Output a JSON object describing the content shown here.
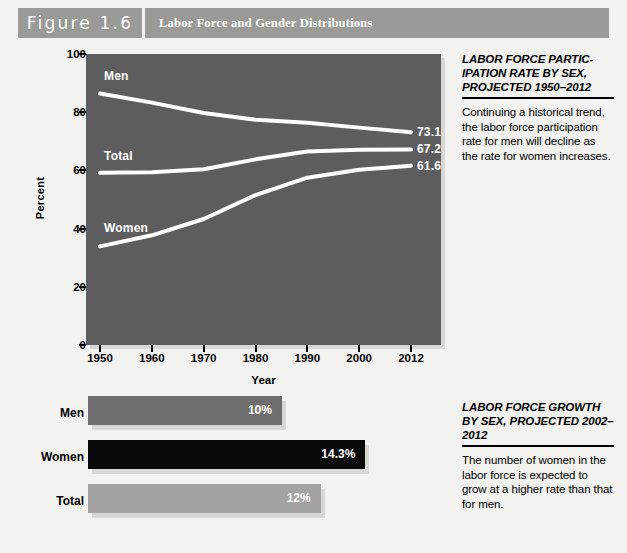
{
  "figure": {
    "number_label": "Figure 1.6",
    "title": "Labor Force and Gender Distributions"
  },
  "colors": {
    "page_background": "#f2f2f0",
    "header_band": "#9a9a98",
    "plot_background": "#5d5d5d",
    "line_color": "#ffffff",
    "bar_men": "#6e6e6e",
    "bar_women": "#0a0a0a",
    "bar_total": "#a3a3a1",
    "shadow": "#d7d7d5"
  },
  "chart_data": [
    {
      "type": "line",
      "id": "labor-force-participation-line",
      "title": "",
      "xlabel": "Year",
      "ylabel": "Percent",
      "ylim": [
        0,
        100
      ],
      "yticks": [
        0,
        20,
        40,
        60,
        80,
        100
      ],
      "x": [
        1950,
        1960,
        1970,
        1980,
        1990,
        2000,
        2012
      ],
      "xtick_labels": [
        "1950",
        "1960",
        "1970",
        "1980",
        "1990",
        "2000",
        "2012"
      ],
      "grid": false,
      "legend": "inline-series-labels",
      "series": [
        {
          "name": "Men",
          "values": [
            86.4,
            83.3,
            79.7,
            77.4,
            76.4,
            74.7,
            73.1
          ],
          "end_label": "73.1"
        },
        {
          "name": "Total",
          "values": [
            59.2,
            59.4,
            60.4,
            63.8,
            66.5,
            67.1,
            67.2
          ],
          "end_label": "67.2"
        },
        {
          "name": "Women",
          "values": [
            33.9,
            37.7,
            43.3,
            51.5,
            57.5,
            60.2,
            61.6
          ],
          "end_label": "61.6"
        }
      ]
    },
    {
      "type": "bar",
      "id": "labor-force-growth-bars",
      "orientation": "horizontal",
      "title": "",
      "xlabel": "",
      "ylabel": "",
      "categories": [
        "Men",
        "Women",
        "Total"
      ],
      "values": [
        10,
        14.3,
        12
      ],
      "value_labels": [
        "10%",
        "14.3%",
        "12%"
      ],
      "xlim": [
        0,
        16.5
      ],
      "grid": false
    }
  ],
  "side_panels": [
    {
      "heading": "LABOR FORCE PARTIC-IPATION RATE BY SEX, PROJECTED 1950–2012",
      "body": "Continuing a historical trend, the labor force participation rate for men will decline as the rate for women increases."
    },
    {
      "heading": "LABOR FORCE GROWTH BY SEX, PROJECTED 2002–2012",
      "body": "The number of women in the labor force is expected to grow at a higher rate than that for men."
    }
  ]
}
